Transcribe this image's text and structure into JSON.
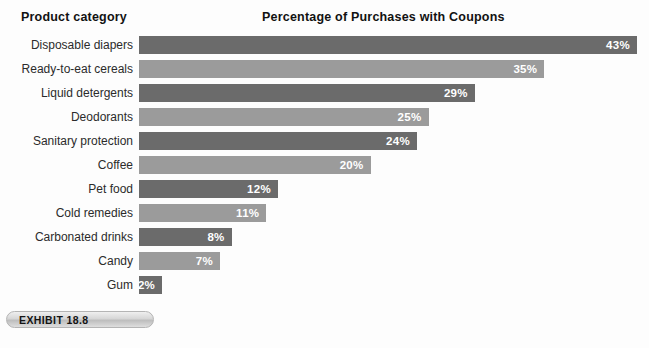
{
  "header": {
    "category_header": "Product category",
    "chart_title": "Percentage of Purchases with Coupons"
  },
  "exhibit": {
    "label": "EXHIBIT 18.8"
  },
  "colors": {
    "bar_dark": "#6b6b6b",
    "bar_light": "#9b9b9b",
    "value_text": "#ffffff",
    "background": "#fdfdfd"
  },
  "chart_data": {
    "type": "bar",
    "orientation": "horizontal",
    "title": "Percentage of Purchases with Coupons",
    "xlabel": "",
    "ylabel": "Product category",
    "xlim": [
      0,
      43
    ],
    "grid": false,
    "legend": "none",
    "unit": "%",
    "categories": [
      "Disposable diapers",
      "Ready-to-eat cereals",
      "Liquid detergents",
      "Deodorants",
      "Sanitary protection",
      "Coffee",
      "Pet food",
      "Cold remedies",
      "Carbonated drinks",
      "Candy",
      "Gum"
    ],
    "values": [
      43,
      35,
      29,
      25,
      24,
      20,
      12,
      11,
      8,
      7,
      2
    ],
    "value_labels": [
      "43%",
      "35%",
      "29%",
      "25%",
      "24%",
      "20%",
      "12%",
      "11%",
      "8%",
      "7%",
      "2%"
    ],
    "bar_shades": [
      "dark",
      "light",
      "dark",
      "light",
      "dark",
      "light",
      "dark",
      "light",
      "dark",
      "light",
      "dark"
    ],
    "px_per_unit": 11.58,
    "bars": [
      {
        "category": "Disposable diapers",
        "value": 43,
        "label": "43%",
        "shade": "dark"
      },
      {
        "category": "Ready-to-eat cereals",
        "value": 35,
        "label": "35%",
        "shade": "light"
      },
      {
        "category": "Liquid detergents",
        "value": 29,
        "label": "29%",
        "shade": "dark"
      },
      {
        "category": "Deodorants",
        "value": 25,
        "label": "25%",
        "shade": "light"
      },
      {
        "category": "Sanitary protection",
        "value": 24,
        "label": "24%",
        "shade": "dark"
      },
      {
        "category": "Coffee",
        "value": 20,
        "label": "20%",
        "shade": "light"
      },
      {
        "category": "Pet food",
        "value": 12,
        "label": "12%",
        "shade": "dark"
      },
      {
        "category": "Cold remedies",
        "value": 11,
        "label": "11%",
        "shade": "light"
      },
      {
        "category": "Carbonated drinks",
        "value": 8,
        "label": "8%",
        "shade": "dark"
      },
      {
        "category": "Candy",
        "value": 7,
        "label": "7%",
        "shade": "light"
      },
      {
        "category": "Gum",
        "value": 2,
        "label": "2%",
        "shade": "dark"
      }
    ]
  }
}
